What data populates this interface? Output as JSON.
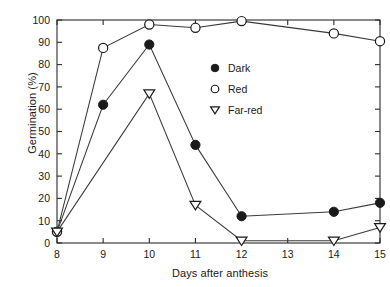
{
  "chart_data": {
    "type": "line",
    "title": "",
    "xlabel": "Days after anthesis",
    "ylabel": "Germination (%)",
    "x": [
      8,
      9,
      10,
      11,
      12,
      13,
      14,
      15
    ],
    "xlim": [
      8,
      15
    ],
    "ylim": [
      0,
      100
    ],
    "xticks": [
      "8",
      "9",
      "10",
      "11",
      "12",
      "13",
      "14",
      "15"
    ],
    "yticks": [
      "0",
      "10",
      "20",
      "30",
      "40",
      "50",
      "60",
      "70",
      "80",
      "90",
      "100"
    ],
    "grid": false,
    "legend_position": "inside-right",
    "series": [
      {
        "name": "Dark",
        "marker": "filled-circle",
        "x": [
          8,
          9,
          10,
          11,
          12,
          14,
          15
        ],
        "values": [
          5,
          62,
          89,
          44,
          12,
          14,
          18
        ]
      },
      {
        "name": "Red",
        "marker": "open-circle",
        "x": [
          8,
          9,
          10,
          11,
          12,
          14,
          15
        ],
        "values": [
          5,
          87.5,
          98,
          96.5,
          99.5,
          94,
          90.5
        ]
      },
      {
        "name": "Far-red",
        "marker": "open-triangle-down",
        "x": [
          8,
          10,
          11,
          12,
          14,
          15
        ],
        "values": [
          5,
          67,
          17,
          1,
          1,
          7
        ]
      }
    ]
  },
  "legend": {
    "entries": [
      {
        "label": "Dark",
        "marker": "filled-circle"
      },
      {
        "label": "Red",
        "marker": "open-circle"
      },
      {
        "label": "Far-red",
        "marker": "open-triangle-down"
      }
    ]
  },
  "colors": {
    "ink": "#1a1a1a",
    "axis": "#2b2b2b",
    "line": "#3a3a3a",
    "background": "#ffffff"
  }
}
